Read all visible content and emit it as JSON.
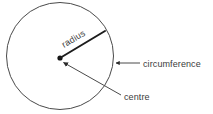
{
  "figure": {
    "background_color": "#ffffff",
    "stroke_color": "#4a4a4a",
    "text_color": "#3b3b3b",
    "radius_line_color": "#1c1c1c"
  },
  "circle": {
    "centre_x": 60,
    "centre_y": 56,
    "radius": 53.5,
    "stroke_width": 1
  },
  "labels": {
    "radius": "radius",
    "circumference": "circumference",
    "centre": "centre"
  },
  "radius_line": {
    "from_x": 60,
    "from_y": 58,
    "to_x": 105,
    "to_y": 31,
    "label_rotation_deg": -31
  },
  "circumference_pointer": {
    "from_x": 140,
    "from_y": 63,
    "to_x": 114,
    "to_y": 63,
    "label_x": 143,
    "label_y": 66
  },
  "centre_pointer": {
    "from_x": 121,
    "from_y": 95,
    "to_x": 61,
    "to_y": 61,
    "label_x": 124,
    "label_y": 100
  }
}
